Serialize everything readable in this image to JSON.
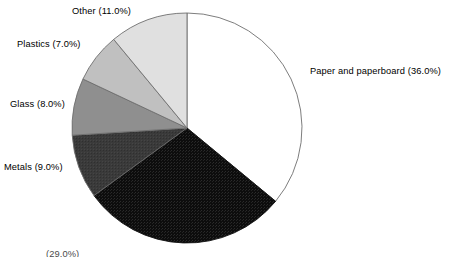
{
  "chart_data": {
    "type": "pie",
    "title": "",
    "subtitle": "",
    "xlabel": "",
    "ylabel": "",
    "legend_position": "none",
    "grid": false,
    "start_angle_deg": 90,
    "direction": "clockwise",
    "units": "percent",
    "total": 100.0,
    "categories": [
      "Paper and paperboard",
      "Yard trimmings",
      "Metals",
      "Glass",
      "Plastics",
      "Other"
    ],
    "values": [
      36.0,
      29.0,
      9.0,
      8.0,
      7.0,
      11.0
    ],
    "slices": [
      {
        "name": "Paper and paperboard",
        "value": 36.0,
        "label": "Paper and paperboard (36.0%)",
        "color": "#ffffff",
        "stroke": "#6e6e6e",
        "label_visible": true
      },
      {
        "name": "Yard trimmings",
        "value": 29.0,
        "label": "(29.0%)",
        "color": "#111111",
        "stroke": "#111111",
        "label_visible": false,
        "label_clipped": true
      },
      {
        "name": "Metals",
        "value": 9.0,
        "label": "Metals (9.0%)",
        "color": "#3a3a3a",
        "stroke": "#6e6e6e",
        "label_visible": true
      },
      {
        "name": "Glass",
        "value": 8.0,
        "label": "Glass (8.0%)",
        "color": "#8f8f8f",
        "stroke": "#6e6e6e",
        "label_visible": true
      },
      {
        "name": "Plastics",
        "value": 7.0,
        "label": "Plastics (7.0%)",
        "color": "#c0c0c0",
        "stroke": "#6e6e6e",
        "label_visible": true
      },
      {
        "name": "Other",
        "value": 11.0,
        "label": "Other (11.0%)",
        "color": "#e0e0e0",
        "stroke": "#6e6e6e",
        "label_visible": true
      }
    ]
  },
  "labels": {
    "paper": "Paper and paperboard (36.0%)",
    "other": "Other (11.0%)",
    "plastics": "Plastics (7.0%)",
    "glass": "Glass (8.0%)",
    "metals": "Metals (9.0%)",
    "clipped_bottom": "(29.0%)"
  },
  "geometry": {
    "center_x": 187,
    "center_y": 128,
    "radius": 115
  },
  "colors": {
    "background": "#ffffff",
    "outline": "#6e6e6e",
    "text": "#000000"
  }
}
